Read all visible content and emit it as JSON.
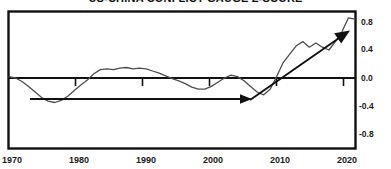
{
  "chart_data": {
    "type": "line",
    "title": "US-CHINA CONFLICT GAUGE Z-SCORE",
    "xlabel": "",
    "ylabel": "",
    "xlim": [
      1970,
      2023
    ],
    "ylim": [
      -1.0,
      1.0
    ],
    "grid": false,
    "legend": "none",
    "x_ticks": [
      "1970",
      "1980",
      "1990",
      "2000",
      "2010",
      "2020"
    ],
    "x_tick_values": [
      1970,
      1980,
      1990,
      2000,
      2010,
      2020
    ],
    "y_ticks": [
      "0.8",
      "0.4",
      "0.0",
      "-0.4",
      "-0.8"
    ],
    "y_tick_values": [
      0.8,
      0.4,
      0.0,
      -0.4,
      -0.8
    ],
    "y_tick_side": "right",
    "zero_line": 0.0,
    "series": [
      {
        "name": "US-China Conflict Gauge Z-Score",
        "color": "#4d4d4d",
        "x": [
          1970,
          1971,
          1972,
          1973,
          1974,
          1975,
          1976,
          1977,
          1978,
          1979,
          1980,
          1981,
          1982,
          1983,
          1984,
          1985,
          1986,
          1987,
          1988,
          1989,
          1990,
          1991,
          1992,
          1993,
          1994,
          1995,
          1996,
          1997,
          1998,
          1999,
          2000,
          2001,
          2002,
          2003,
          2004,
          2005,
          2006,
          2007,
          2008,
          2009,
          2010,
          2011,
          2012,
          2013,
          2014,
          2015,
          2016,
          2017,
          2018,
          2019,
          2020,
          2021,
          2022,
          2023
        ],
        "values": [
          0.02,
          0.0,
          -0.05,
          -0.12,
          -0.2,
          -0.28,
          -0.33,
          -0.35,
          -0.32,
          -0.26,
          -0.18,
          -0.1,
          -0.03,
          0.06,
          0.12,
          0.13,
          0.12,
          0.14,
          0.15,
          0.13,
          0.14,
          0.13,
          0.1,
          0.07,
          0.03,
          -0.01,
          -0.04,
          -0.08,
          -0.13,
          -0.16,
          -0.16,
          -0.12,
          -0.06,
          0.0,
          0.04,
          0.02,
          -0.04,
          -0.12,
          -0.2,
          -0.24,
          -0.16,
          0.02,
          0.22,
          0.34,
          0.46,
          0.52,
          0.44,
          0.5,
          0.44,
          0.4,
          0.52,
          0.66,
          0.86,
          0.84
        ]
      }
    ],
    "annotations": [
      {
        "name": "flat-trend-arrow",
        "type": "arrow",
        "x_start": 1972,
        "y_start": -0.42,
        "x_end": 2008,
        "y_end": -0.42,
        "color": "#111111",
        "description": "Flat horizontal arrow spanning the pre-2008 era"
      },
      {
        "name": "rising-trend-arrow",
        "type": "arrow",
        "x_start": 2008,
        "y_start": -0.42,
        "x_end": 2022,
        "y_end": 0.62,
        "color": "#111111",
        "description": "Rising arrow showing sharp escalation after 2008"
      }
    ]
  }
}
